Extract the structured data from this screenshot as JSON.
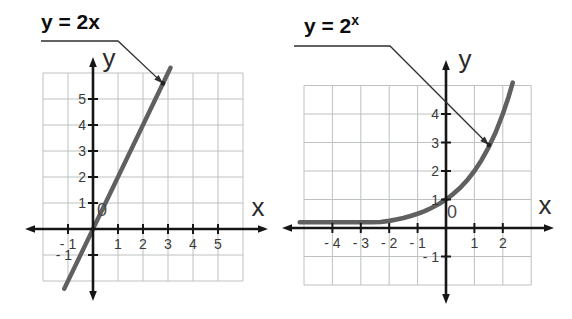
{
  "colors": {
    "background": "#ffffff",
    "axis": "#161616",
    "grid": "#bcc2bf",
    "curve": "#606060",
    "tick_label": "#3a3a3a",
    "origin_label": "#4a4a4a",
    "axis_letter": "#2b2b2b",
    "title": "#0d0d0d",
    "leader": "#2f2f2f"
  },
  "chart_data": [
    {
      "id": "linear-graph",
      "type": "line",
      "equation": "y = 2x",
      "title": {
        "base": "y = 2x",
        "sup": ""
      },
      "xlabel": "x",
      "ylabel": "y",
      "origin_label": "0",
      "xlim": [
        -2,
        6
      ],
      "ylim": [
        -2,
        6
      ],
      "grid": true,
      "x_ticks": [
        {
          "v": -1,
          "t": "- 1"
        },
        {
          "v": 1,
          "t": "1"
        },
        {
          "v": 2,
          "t": "2"
        },
        {
          "v": 3,
          "t": "3"
        },
        {
          "v": 4,
          "t": "4"
        },
        {
          "v": 5,
          "t": "5"
        }
      ],
      "y_ticks": [
        {
          "v": 5,
          "t": "5"
        },
        {
          "v": 4,
          "t": "4"
        },
        {
          "v": 3,
          "t": "3"
        },
        {
          "v": 2,
          "t": "2"
        },
        {
          "v": 1,
          "t": "1"
        },
        {
          "v": -1,
          "t": "- 1",
          "dx": -14
        }
      ],
      "points": [
        [
          -1.15,
          -2.3
        ],
        [
          3.1,
          6.2
        ]
      ],
      "callout": {
        "label_px": [
          41,
          29
        ],
        "leader_px": [
          [
            41,
            41
          ],
          [
            118,
            41
          ]
        ],
        "dot_unit": [
          2.8,
          5.6
        ]
      },
      "layout": {
        "origin_px": [
          93,
          229
        ],
        "unit_px": [
          25,
          26
        ],
        "x_axis_px": [
          25,
          268
        ],
        "y_axis_px": [
          57,
          301
        ],
        "xlabel_px": [
          258,
          216
        ],
        "ylabel_px": [
          109,
          67
        ],
        "origin_label_px": [
          102,
          216
        ],
        "stroke_width": 4.4
      }
    },
    {
      "id": "exponential-graph",
      "type": "line",
      "equation": "y = 2^x",
      "title": {
        "base": "y = 2",
        "sup": "x"
      },
      "xlabel": "x",
      "ylabel": "y",
      "origin_label": "0",
      "xlim": [
        -5,
        3
      ],
      "ylim": [
        -2,
        5
      ],
      "grid": true,
      "x_ticks": [
        {
          "v": -4,
          "t": "- 4"
        },
        {
          "v": -3,
          "t": "- 3"
        },
        {
          "v": -2,
          "t": "- 2"
        },
        {
          "v": -1,
          "t": "- 1"
        },
        {
          "v": 1,
          "t": "1"
        },
        {
          "v": 2,
          "t": "2"
        }
      ],
      "y_ticks": [
        {
          "v": 4,
          "t": "4"
        },
        {
          "v": 3,
          "t": "3"
        },
        {
          "v": 2,
          "t": "2"
        },
        {
          "v": 1,
          "t": "1"
        },
        {
          "v": -1,
          "t": "- 1"
        }
      ],
      "points": [
        [
          -5.15,
          0.2
        ],
        [
          -4.5,
          0.2
        ],
        [
          -4,
          0.2
        ],
        [
          -3.5,
          0.2
        ],
        [
          -3,
          0.2
        ],
        [
          -2.6,
          0.2
        ],
        [
          -2.3,
          0.21
        ],
        [
          -2,
          0.25
        ],
        [
          -1.75,
          0.3
        ],
        [
          -1.5,
          0.35
        ],
        [
          -1.25,
          0.42
        ],
        [
          -1,
          0.5
        ],
        [
          -0.75,
          0.59
        ],
        [
          -0.5,
          0.71
        ],
        [
          -0.25,
          0.84
        ],
        [
          0,
          1
        ],
        [
          0.25,
          1.19
        ],
        [
          0.5,
          1.41
        ],
        [
          0.75,
          1.68
        ],
        [
          1,
          2
        ],
        [
          1.25,
          2.38
        ],
        [
          1.5,
          2.83
        ],
        [
          1.75,
          3.36
        ],
        [
          2,
          4
        ],
        [
          2.2,
          4.59
        ],
        [
          2.35,
          5.1
        ]
      ],
      "callout": {
        "label_px": [
          304,
          33
        ],
        "leader_px": [
          [
            294,
            46
          ],
          [
            390,
            46
          ]
        ],
        "dot_unit": [
          1.51,
          2.91
        ]
      },
      "layout": {
        "origin_px": [
          446,
          228
        ],
        "unit_px": [
          28.4,
          28.5
        ],
        "x_axis_px": [
          282,
          554
        ],
        "y_axis_px": [
          60,
          304
        ],
        "xlabel_px": [
          545,
          214
        ],
        "ylabel_px": [
          465,
          68
        ],
        "origin_label_px": [
          452,
          218
        ],
        "stroke_width": 4.6
      }
    }
  ]
}
